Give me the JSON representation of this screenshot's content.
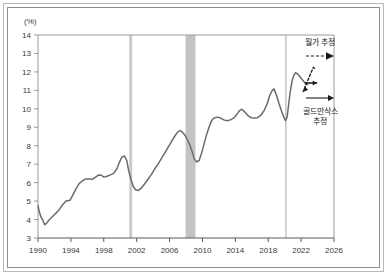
{
  "chart_data": {
    "type": "line",
    "title": "",
    "xlabel": "",
    "ylabel": "(%)",
    "yunit_label": "(%)",
    "xlim": [
      1990,
      2026
    ],
    "ylim": [
      3,
      14
    ],
    "ytick_labels": [
      "14",
      "13",
      "12",
      "11",
      "10",
      "9",
      "8",
      "7",
      "6",
      "5",
      "4",
      "3"
    ],
    "ytick_values": [
      14,
      13,
      12,
      11,
      10,
      9,
      8,
      7,
      6,
      5,
      4,
      3
    ],
    "xtick_labels": [
      "1990",
      "1994",
      "1998",
      "2002",
      "2006",
      "2010",
      "2014",
      "2018",
      "2022",
      "2026"
    ],
    "xtick_values": [
      1990,
      1994,
      1998,
      2002,
      2006,
      2010,
      2014,
      2018,
      2022,
      2026
    ],
    "grid": false,
    "legend_position": "inside-right",
    "series": [
      {
        "name": "actual",
        "style": "solid",
        "color": "#6b6b6b",
        "points": [
          [
            1990.0,
            4.75
          ],
          [
            1990.2,
            4.35
          ],
          [
            1990.4,
            4.1
          ],
          [
            1990.6,
            3.95
          ],
          [
            1990.8,
            3.72
          ],
          [
            1991.0,
            3.78
          ],
          [
            1991.4,
            4.0
          ],
          [
            1991.8,
            4.18
          ],
          [
            1992.2,
            4.35
          ],
          [
            1992.6,
            4.55
          ],
          [
            1993.0,
            4.8
          ],
          [
            1993.4,
            5.0
          ],
          [
            1993.6,
            5.02
          ],
          [
            1993.9,
            5.05
          ],
          [
            1994.2,
            5.3
          ],
          [
            1994.6,
            5.65
          ],
          [
            1995.0,
            5.95
          ],
          [
            1995.4,
            6.1
          ],
          [
            1995.8,
            6.2
          ],
          [
            1996.2,
            6.2
          ],
          [
            1996.6,
            6.18
          ],
          [
            1997.0,
            6.3
          ],
          [
            1997.4,
            6.42
          ],
          [
            1997.7,
            6.4
          ],
          [
            1998.0,
            6.3
          ],
          [
            1998.4,
            6.35
          ],
          [
            1998.8,
            6.42
          ],
          [
            1999.2,
            6.5
          ],
          [
            1999.6,
            6.75
          ],
          [
            1999.9,
            7.1
          ],
          [
            2000.2,
            7.38
          ],
          [
            2000.5,
            7.45
          ],
          [
            2000.8,
            7.2
          ],
          [
            2001.0,
            6.7
          ],
          [
            2001.3,
            6.2
          ],
          [
            2001.6,
            5.78
          ],
          [
            2001.9,
            5.6
          ],
          [
            2002.2,
            5.58
          ],
          [
            2002.6,
            5.72
          ],
          [
            2003.0,
            5.95
          ],
          [
            2003.4,
            6.2
          ],
          [
            2003.8,
            6.45
          ],
          [
            2004.2,
            6.75
          ],
          [
            2004.6,
            7.0
          ],
          [
            2005.0,
            7.3
          ],
          [
            2005.4,
            7.6
          ],
          [
            2005.8,
            7.9
          ],
          [
            2006.2,
            8.2
          ],
          [
            2006.6,
            8.5
          ],
          [
            2007.0,
            8.75
          ],
          [
            2007.3,
            8.82
          ],
          [
            2007.6,
            8.72
          ],
          [
            2007.9,
            8.55
          ],
          [
            2008.2,
            8.3
          ],
          [
            2008.5,
            8.0
          ],
          [
            2008.8,
            7.6
          ],
          [
            2009.0,
            7.3
          ],
          [
            2009.3,
            7.12
          ],
          [
            2009.6,
            7.2
          ],
          [
            2009.9,
            7.6
          ],
          [
            2010.2,
            8.1
          ],
          [
            2010.5,
            8.6
          ],
          [
            2010.8,
            9.0
          ],
          [
            2011.1,
            9.35
          ],
          [
            2011.4,
            9.5
          ],
          [
            2011.8,
            9.55
          ],
          [
            2012.2,
            9.5
          ],
          [
            2012.6,
            9.4
          ],
          [
            2013.0,
            9.35
          ],
          [
            2013.4,
            9.4
          ],
          [
            2013.8,
            9.5
          ],
          [
            2014.2,
            9.7
          ],
          [
            2014.5,
            9.9
          ],
          [
            2014.8,
            9.98
          ],
          [
            2015.1,
            9.85
          ],
          [
            2015.5,
            9.65
          ],
          [
            2015.9,
            9.52
          ],
          [
            2016.3,
            9.5
          ],
          [
            2016.7,
            9.52
          ],
          [
            2017.1,
            9.65
          ],
          [
            2017.5,
            9.9
          ],
          [
            2017.9,
            10.3
          ],
          [
            2018.2,
            10.75
          ],
          [
            2018.5,
            11.0
          ],
          [
            2018.7,
            11.08
          ],
          [
            2019.0,
            10.75
          ],
          [
            2019.3,
            10.3
          ],
          [
            2019.6,
            9.9
          ],
          [
            2019.9,
            9.55
          ],
          [
            2020.1,
            9.35
          ],
          [
            2020.3,
            9.55
          ],
          [
            2020.5,
            10.3
          ],
          [
            2020.7,
            11.0
          ],
          [
            2020.9,
            11.5
          ],
          [
            2021.1,
            11.8
          ],
          [
            2021.3,
            11.95
          ],
          [
            2021.5,
            11.92
          ],
          [
            2021.8,
            11.78
          ],
          [
            2022.0,
            11.65
          ],
          [
            2022.3,
            11.5
          ],
          [
            2022.6,
            11.35
          ],
          [
            2022.8,
            11.3
          ]
        ]
      },
      {
        "name": "wall-street-forecast",
        "style": "dashed",
        "color": "#1a1a1a",
        "points": [
          [
            2022.4,
            11.08
          ],
          [
            2022.7,
            11.45
          ],
          [
            2022.9,
            11.62
          ],
          [
            2023.2,
            11.95
          ],
          [
            2023.5,
            12.25
          ],
          [
            2023.8,
            12.12
          ]
        ]
      },
      {
        "name": "goldman-sachs-forecast",
        "style": "solid-flat",
        "color": "#1a1a1a",
        "points": [
          [
            2022.5,
            11.4
          ],
          [
            2023.9,
            11.4
          ]
        ]
      }
    ],
    "shaded_bands": [
      {
        "name": "recession-2001",
        "x_start": 2001.1,
        "x_end": 2001.45,
        "color": "#c9c9c9"
      },
      {
        "name": "recession-2008",
        "x_start": 2007.95,
        "x_end": 2009.15,
        "color": "#c3c3c3"
      },
      {
        "name": "recession-2020",
        "x_start": 2020.05,
        "x_end": 2020.18,
        "color": "#c9c9c9"
      }
    ],
    "annotations": [
      {
        "name": "wall-street-estimate",
        "label": "월가 추정",
        "arrow_style": "dashed",
        "label_x": 2023.0,
        "label_y": 13.5
      },
      {
        "name": "goldman-sachs-estimate",
        "label_line1": "골드만삭스",
        "label_line2": "추정",
        "arrow_style": "solid",
        "label_x": 2023.0,
        "label_y": 9.5
      }
    ]
  },
  "annotations_flat": {
    "wall_street": "월가 추정",
    "goldman_line1": "골드만삭스",
    "goldman_line2": "추정"
  }
}
